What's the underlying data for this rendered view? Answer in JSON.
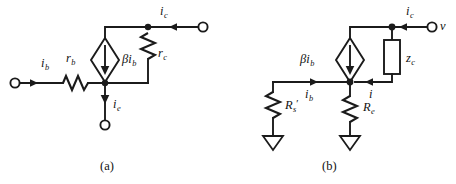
{
  "figure": {
    "kind": "circuit-diagram",
    "background_color": "#ffffff",
    "ink_color": "#1b1b1b",
    "panels": [
      {
        "id": "a",
        "caption": "(a)",
        "title": "Transistor small-signal model with r_b and r_c",
        "labels": {
          "ib": "i",
          "ib_sub": "b",
          "rb": "r",
          "rb_sub": "b",
          "ic": "i",
          "ic_sub": "c",
          "rc": "r",
          "rc_sub": "c",
          "ie": "i",
          "ie_sub": "e",
          "source_beta": "βi",
          "source_sub": "b"
        },
        "components": [
          {
            "name": "base-resistor",
            "label": "r_b",
            "type": "resistor-zigzag",
            "orientation": "horizontal"
          },
          {
            "name": "collector-resistor",
            "label": "r_c",
            "type": "resistor-zigzag",
            "orientation": "vertical"
          },
          {
            "name": "dependent-current-source",
            "label": "βi_b",
            "type": "diamond-source",
            "arrow_direction": "down"
          },
          {
            "name": "base-terminal",
            "type": "open-terminal"
          },
          {
            "name": "collector-terminal",
            "type": "open-terminal"
          },
          {
            "name": "emitter-terminal",
            "type": "open-terminal"
          }
        ],
        "currents": [
          {
            "name": "ib",
            "label": "i_b",
            "direction": "right"
          },
          {
            "name": "ic",
            "label": "i_c",
            "direction": "left"
          },
          {
            "name": "ie",
            "label": "i_e",
            "direction": "down"
          }
        ]
      },
      {
        "id": "b",
        "caption": "(b)",
        "title": "Equivalent circuit with R'_s, R_e and z_c",
        "labels": {
          "ib": "i",
          "ib_sub": "b",
          "i": "i",
          "ic": "i",
          "ic_sub": "c",
          "v": "v",
          "zc": "z",
          "zc_sub": "c",
          "Rs": "R",
          "Rs_sub": "s",
          "Rs_prime": "′",
          "Re": "R",
          "Re_sub": "e",
          "source_beta": "βi",
          "source_sub": "b"
        },
        "components": [
          {
            "name": "source-resistor",
            "label": "R'_s",
            "type": "resistor-zigzag",
            "orientation": "vertical"
          },
          {
            "name": "emitter-resistor",
            "label": "R_e",
            "type": "resistor-zigzag",
            "orientation": "vertical"
          },
          {
            "name": "collector-impedance",
            "label": "z_c",
            "type": "box-impedance",
            "orientation": "vertical"
          },
          {
            "name": "dependent-current-source",
            "label": "βi_b",
            "type": "diamond-source",
            "arrow_direction": "down"
          },
          {
            "name": "output-terminal",
            "type": "open-terminal",
            "label": "v"
          },
          {
            "name": "ground-source-resistor",
            "type": "ground-triangle"
          },
          {
            "name": "ground-emitter-resistor",
            "type": "ground-triangle"
          }
        ],
        "currents": [
          {
            "name": "ib",
            "label": "i_b",
            "direction": "right"
          },
          {
            "name": "i",
            "label": "i",
            "direction": "left"
          },
          {
            "name": "ic",
            "label": "i_c",
            "direction": "left"
          }
        ]
      }
    ]
  }
}
